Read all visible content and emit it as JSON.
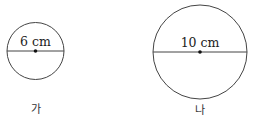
{
  "figures": [
    {
      "id": "ga",
      "name": "가",
      "diameter_label": "6 cm",
      "cx": 35.5,
      "cy": 51,
      "r": 28.5
    },
    {
      "id": "na",
      "name": "나",
      "diameter_label": "10 cm",
      "cx": 200,
      "cy": 52,
      "r": 47
    }
  ],
  "colors": {
    "stroke": "#444444",
    "center": "#111111",
    "background": "#ffffff"
  }
}
